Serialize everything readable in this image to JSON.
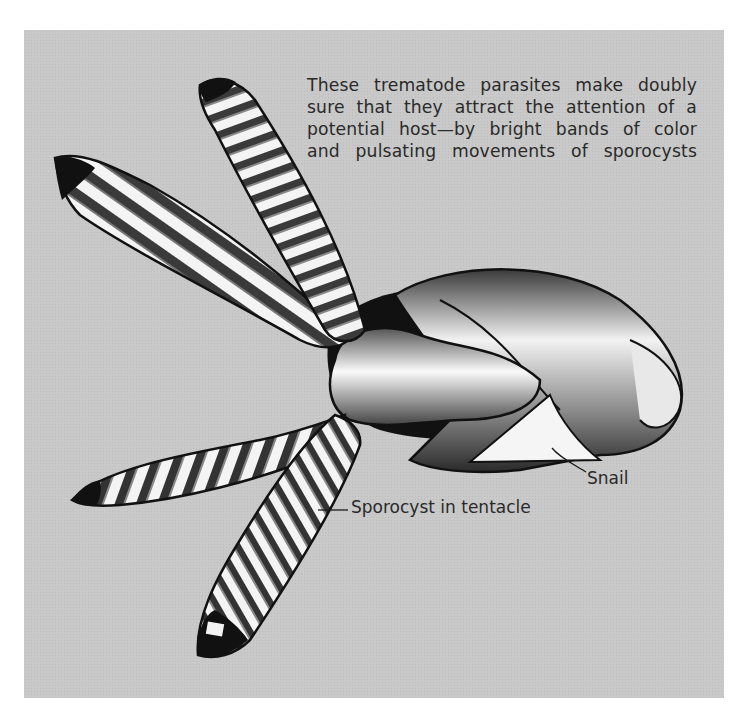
{
  "figure": {
    "caption_lines": [
      "These trematode parasites make doubly",
      "sure that they attract the attention of a",
      "potential host—by bright bands of color",
      "and pulsating movements of sporocysts"
    ],
    "labels": {
      "snail": "Snail",
      "sporocyst": "Sporocyst in tentacle"
    },
    "colors": {
      "background": "#c9c9c9",
      "ink": "#1a1a1a",
      "text": "#2a2a2a"
    }
  }
}
